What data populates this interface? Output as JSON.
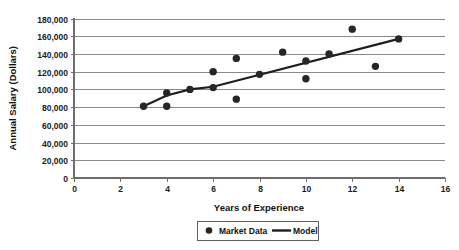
{
  "chart_data": {
    "type": "scatter",
    "title": "",
    "xlabel": "Years of Experience",
    "ylabel": "Annual Salary (Dollars)",
    "xlim": [
      0,
      16
    ],
    "ylim": [
      0,
      180000
    ],
    "xticks": [
      0,
      2,
      4,
      6,
      8,
      10,
      12,
      14,
      16
    ],
    "xtick_labels": [
      "0",
      "2",
      "4",
      "6",
      "8",
      "10",
      "12",
      "14",
      "16"
    ],
    "yticks": [
      0,
      20000,
      40000,
      60000,
      80000,
      100000,
      120000,
      140000,
      160000,
      180000
    ],
    "ytick_labels": [
      "0",
      "20,000",
      "40,000",
      "60,000",
      "80,000",
      "100,000",
      "120,000",
      "140,000",
      "160,000",
      "180,000"
    ],
    "grid": "horizontal",
    "legend_position": "bottom-center",
    "series": [
      {
        "name": "Market Data",
        "type": "scatter",
        "marker": "circle",
        "color": "#262626",
        "points": [
          {
            "x": 3,
            "y": 81000
          },
          {
            "x": 4,
            "y": 96000
          },
          {
            "x": 4,
            "y": 81000
          },
          {
            "x": 5,
            "y": 100000
          },
          {
            "x": 6,
            "y": 120000
          },
          {
            "x": 6,
            "y": 102000
          },
          {
            "x": 7,
            "y": 135000
          },
          {
            "x": 7,
            "y": 89000
          },
          {
            "x": 8,
            "y": 117000
          },
          {
            "x": 9,
            "y": 142000
          },
          {
            "x": 10,
            "y": 132000
          },
          {
            "x": 10,
            "y": 112000
          },
          {
            "x": 11,
            "y": 140000
          },
          {
            "x": 12,
            "y": 168000
          },
          {
            "x": 13,
            "y": 126000
          },
          {
            "x": 14,
            "y": 157000
          }
        ]
      },
      {
        "name": "Model",
        "type": "line",
        "color": "#1d1d1d",
        "points": [
          {
            "x": 3,
            "y": 81000
          },
          {
            "x": 4,
            "y": 93000
          },
          {
            "x": 5,
            "y": 100000
          },
          {
            "x": 6,
            "y": 103000
          },
          {
            "x": 14,
            "y": 157000
          }
        ]
      }
    ],
    "legend": [
      {
        "label": "Market Data",
        "symbol": "circle-marker",
        "color": "#262626"
      },
      {
        "label": "Model",
        "symbol": "line-swatch",
        "color": "#1d1d1d"
      }
    ]
  },
  "colors": {
    "marker": "#262626",
    "model_line": "#1d1d1d",
    "gridline": "#8a8a8a",
    "axis": "#6e6e6e",
    "text": "#111111",
    "background": "#ffffff"
  }
}
